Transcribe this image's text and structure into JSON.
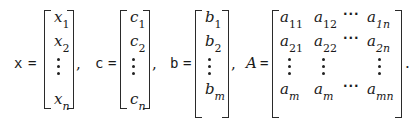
{
  "equation": {
    "x": {
      "label": "x",
      "equals": "=",
      "entries": [
        {
          "base": "x",
          "sub": "1"
        },
        {
          "base": "x",
          "sub": "2"
        },
        {
          "base": "x",
          "sub": "n"
        }
      ],
      "separator": ","
    },
    "c": {
      "label": "c",
      "equals": "=",
      "entries": [
        {
          "base": "c",
          "sub": "1"
        },
        {
          "base": "c",
          "sub": "2"
        },
        {
          "base": "c",
          "sub": "n"
        }
      ],
      "separator": ","
    },
    "b": {
      "label": "b",
      "equals": "=",
      "entries": [
        {
          "base": "b",
          "sub": "1"
        },
        {
          "base": "b",
          "sub": "2"
        },
        {
          "base": "b",
          "sub": "m"
        }
      ],
      "separator": ","
    },
    "A": {
      "label": "A",
      "equals": "=",
      "rows": [
        [
          {
            "base": "a",
            "sub": "11"
          },
          {
            "base": "a",
            "sub": "12"
          },
          {
            "base": "a",
            "sub": "1n"
          }
        ],
        [
          {
            "base": "a",
            "sub": "21"
          },
          {
            "base": "a",
            "sub": "22"
          },
          {
            "base": "a",
            "sub": "2n"
          }
        ],
        [
          {
            "base": "a",
            "sub": "m"
          },
          {
            "base": "a",
            "sub": "m"
          },
          {
            "base": "a",
            "sub": "mn"
          }
        ]
      ],
      "hdots": "···",
      "terminator": "."
    }
  }
}
